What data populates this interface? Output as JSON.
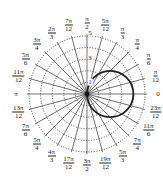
{
  "chart_data": {
    "type": "polar",
    "title": "",
    "curve": {
      "equation": "r = 4cos(theta)",
      "shape": "circle",
      "diameter": 4,
      "center": [
        2,
        0
      ],
      "color": "#222222"
    },
    "radial_axis": {
      "range": [
        0,
        5
      ],
      "rings": [
        1,
        2,
        3,
        4,
        5
      ],
      "tick_labels": [
        "1",
        "3",
        "5"
      ],
      "grid": "dotted"
    },
    "angular_axis": {
      "step": "pi/12",
      "tick_labels": [
        "0",
        "π/12",
        "π/6",
        "π/4",
        "π/3",
        "5π/12",
        "π/2",
        "7π/12",
        "2π/3",
        "3π/4",
        "5π/6",
        "11π/12",
        "π",
        "13π/12",
        "7π/6",
        "5π/4",
        "4π/3",
        "17π/12",
        "3π/2",
        "19π/12",
        "5π/3",
        "7π/4",
        "11π/6",
        "23π/12"
      ],
      "grid": "solid"
    }
  },
  "labels": [
    {
      "n": "",
      "d": "0"
    },
    {
      "n": "π",
      "d": "12"
    },
    {
      "n": "π",
      "d": "6"
    },
    {
      "n": "π",
      "d": "4"
    },
    {
      "n": "π",
      "d": "3"
    },
    {
      "n": "5π",
      "d": "12"
    },
    {
      "n": "π",
      "d": "2"
    },
    {
      "n": "7π",
      "d": "12"
    },
    {
      "n": "2π",
      "d": "3"
    },
    {
      "n": "3π",
      "d": "4"
    },
    {
      "n": "5π",
      "d": "6"
    },
    {
      "n": "11π",
      "d": "12"
    },
    {
      "n": "",
      "d": "π"
    },
    {
      "n": "13π",
      "d": "12"
    },
    {
      "n": "7π",
      "d": "6"
    },
    {
      "n": "5π",
      "d": "4"
    },
    {
      "n": "4π",
      "d": "3"
    },
    {
      "n": "17π",
      "d": "12"
    },
    {
      "n": "3π",
      "d": "2"
    },
    {
      "n": "19π",
      "d": "12"
    },
    {
      "n": "5π",
      "d": "3"
    },
    {
      "n": "7π",
      "d": "4"
    },
    {
      "n": "11π",
      "d": "6"
    },
    {
      "n": "23π",
      "d": "12"
    }
  ],
  "radial_labels": [
    "1",
    "3",
    "5"
  ]
}
